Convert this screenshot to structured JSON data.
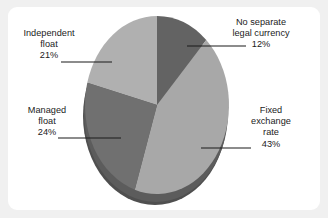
{
  "chart_data": {
    "type": "pie",
    "title": "",
    "subtitle": "",
    "xlabel": "",
    "ylabel": "",
    "legend_position": "none",
    "grid": false,
    "style": "3d-pie",
    "start_angle_deg": 0,
    "direction": "clockwise",
    "categories": [
      "No separate legal currency",
      "Fixed exchange rate",
      "Managed float",
      "Independent float"
    ],
    "values": [
      12,
      43,
      24,
      21
    ],
    "value_unit": "%",
    "colors": [
      "#636363",
      "#a8a8a8",
      "#707070",
      "#b0b0b0"
    ],
    "slices": [
      {
        "name": "No separate legal currency",
        "label_lines": [
          "No separate",
          "legal currency"
        ],
        "value": 12,
        "value_label": "12%",
        "color": "#636363"
      },
      {
        "name": "Fixed exchange rate",
        "label_lines": [
          "Fixed",
          "exchange",
          "rate"
        ],
        "value": 43,
        "value_label": "43%",
        "color": "#a8a8a8"
      },
      {
        "name": "Managed float",
        "label_lines": [
          "Managed",
          "float"
        ],
        "value": 24,
        "value_label": "24%",
        "color": "#707070"
      },
      {
        "name": "Independent float",
        "label_lines": [
          "Independent",
          "float"
        ],
        "value": 21,
        "value_label": "21%",
        "color": "#b0b0b0"
      }
    ]
  },
  "labels": {
    "no_separate": {
      "line1": "No separate",
      "line2": "legal currency",
      "value": "12%"
    },
    "fixed": {
      "line1": "Fixed",
      "line2": "exchange",
      "line3": "rate",
      "value": "43%"
    },
    "managed": {
      "line1": "Managed",
      "line2": "float",
      "value": "24%"
    },
    "independent": {
      "line1": "Independent",
      "line2": "float",
      "value": "21%"
    }
  },
  "colors": {
    "background": "#f0f0f0",
    "panel": "#ffffff",
    "text": "#1b1b1b",
    "leader_line": "#1b1b1b",
    "slice_no_separate": "#636363",
    "slice_fixed": "#a8a8a8",
    "slice_managed": "#707070",
    "slice_independent": "#b0b0b0",
    "depth_wall": "#4f4f4f",
    "depth_wall_light": "#6f6f6f"
  }
}
